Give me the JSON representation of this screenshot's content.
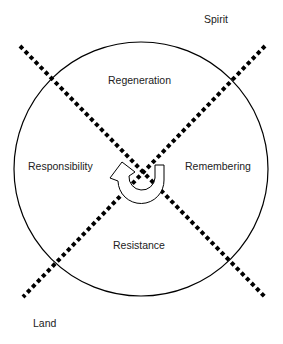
{
  "diagram": {
    "corner_labels": {
      "top_right": "Spirit",
      "bottom_left": "Land"
    },
    "quadrants": {
      "top": "Regeneration",
      "left": "Responsibility",
      "right": "Remembering",
      "bottom": "Resistance"
    },
    "center_icon": "circular-arrow-icon",
    "colors": {
      "line": "#000000",
      "text": "#222222",
      "background": "#ffffff"
    }
  }
}
